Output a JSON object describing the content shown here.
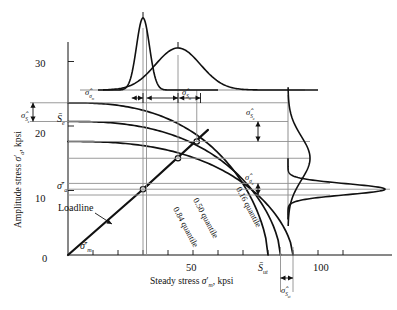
{
  "figure": {
    "type": "engineering-diagram",
    "axes": {
      "x": {
        "title_prefix": "Steady stress ",
        "title_symbol": "σ",
        "title_sub": "m",
        "title_suffix": ", kpsi",
        "ticks": [
          0,
          10,
          20,
          30,
          40,
          50,
          60,
          70,
          80,
          90,
          100,
          110
        ],
        "labeled_ticks": [
          {
            "value": 0,
            "label": "0"
          },
          {
            "value": 50,
            "label": "50"
          },
          {
            "value": 100,
            "label": "100"
          }
        ],
        "min": 0,
        "max": 115
      },
      "y": {
        "title_prefix": "Amplitude stress ",
        "title_symbol": "σ",
        "title_sub": "a",
        "title_suffix": ", kpsi",
        "ticks": [
          0,
          10,
          20,
          30
        ],
        "labeled_ticks": [
          {
            "value": 0,
            "label": "0"
          },
          {
            "value": 10,
            "label": "10"
          },
          {
            "value": 20,
            "label": "20"
          },
          {
            "value": 30,
            "label": "30"
          }
        ],
        "min": 0,
        "max": 33
      }
    },
    "curves": [
      {
        "name": "0.84 quantile",
        "label": "0.84 quantile",
        "y_intercept": 23.6,
        "x_intercept": 80.0
      },
      {
        "name": "0.50 quantile",
        "label": "0.50 quantile",
        "y_intercept": 20.7,
        "x_intercept": 85.0
      },
      {
        "name": "0.16 quantile",
        "label": "0.16 quantile",
        "y_intercept": 17.6,
        "x_intercept": 90.0
      }
    ],
    "loadline": {
      "label": "Loadline",
      "from": [
        0,
        0
      ],
      "to": [
        33,
        11.2
      ]
    },
    "intersection_points": [
      {
        "x": 30.0,
        "y": 10.2
      },
      {
        "x": 44.0,
        "y": 15.0
      },
      {
        "x": 51.5,
        "y": 17.6
      }
    ],
    "distributions": {
      "top_narrow": {
        "name": "sigma-m-prime-distribution",
        "center": 30.0,
        "spread": 2.6,
        "orientation": "vertical-pdf"
      },
      "top_broad": {
        "name": "S-m-distribution",
        "center": 44.0,
        "spread": 9.0,
        "orientation": "vertical-pdf"
      },
      "right_broad": {
        "name": "S-a-distribution",
        "center": 15.0,
        "spread": 3.4,
        "orientation": "horizontal-pdf"
      },
      "right_narrow": {
        "name": "sigma-a-prime-distribution",
        "center": 10.2,
        "spread": 0.85,
        "orientation": "horizontal-pdf"
      }
    },
    "annotations": {
      "sigma_hat_m": {
        "symbol": "σ̂",
        "sub": "σ",
        "sub2": "m",
        "text": "σ̂"
      },
      "sigma_hat_Sm": {
        "text": "σ̂",
        "sub": "S",
        "sub2": "m"
      },
      "sigma_hat_Se": {
        "text": "σ̂",
        "sub": "S",
        "sub2": "e"
      },
      "sigma_hat_Sa": {
        "text": "σ̂",
        "sub": "S",
        "sub2": "a"
      },
      "sigma_hat_sigma_a": {
        "text": "σ̂",
        "sub": "σ",
        "sub2": "a"
      },
      "sigma_hat_Sut": {
        "text": "σ̂",
        "sub": "S",
        "sub2": "ut"
      },
      "S_bar_e": {
        "text": "S̄",
        "sub": "e",
        "value": 20.7
      },
      "S_bar_ut": {
        "text": "S̄",
        "sub": "ut",
        "value": 85.0
      },
      "sigma_bar_a": {
        "text": "σ̄",
        "sub": "a",
        "prime": true,
        "value": 10.2
      },
      "sigma_bar_m": {
        "text": "σ̄",
        "sub": "m",
        "prime": true,
        "value": 30.0
      }
    },
    "colors": {
      "ink": "#111111",
      "grid": "#8f8f8f",
      "background": "#ffffff"
    }
  }
}
